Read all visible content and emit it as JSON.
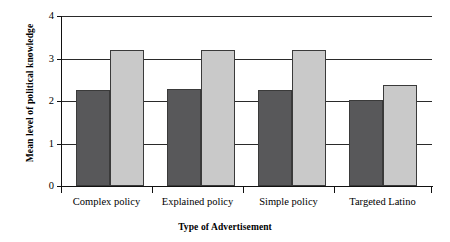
{
  "chart_data": {
    "type": "bar",
    "title": "",
    "subtitle": "",
    "xlabel": "Type of Advertisement",
    "ylabel": "Mean level of political knowledge",
    "categories": [
      "Complex policy",
      "Explained policy",
      "Simple policy",
      "Targeted Latino"
    ],
    "series": [
      {
        "name": "dark-series",
        "color": "#58585a",
        "values": [
          2.25,
          2.28,
          2.27,
          2.03
        ]
      },
      {
        "name": "light-series",
        "color": "#c9c9c9",
        "values": [
          3.2,
          3.2,
          3.2,
          2.37
        ]
      }
    ],
    "ylim": [
      0,
      4
    ],
    "yticks": [
      0,
      1,
      2,
      3,
      4
    ],
    "ytick_labels": [
      "0",
      "1",
      "2",
      "3",
      "4"
    ],
    "grid": true,
    "grid_axis": "y",
    "legend": "none",
    "legend_position": "none",
    "annotations": []
  },
  "axis": {
    "y_title": "Mean level of political knowledge",
    "x_title": "Type of Advertisement"
  }
}
